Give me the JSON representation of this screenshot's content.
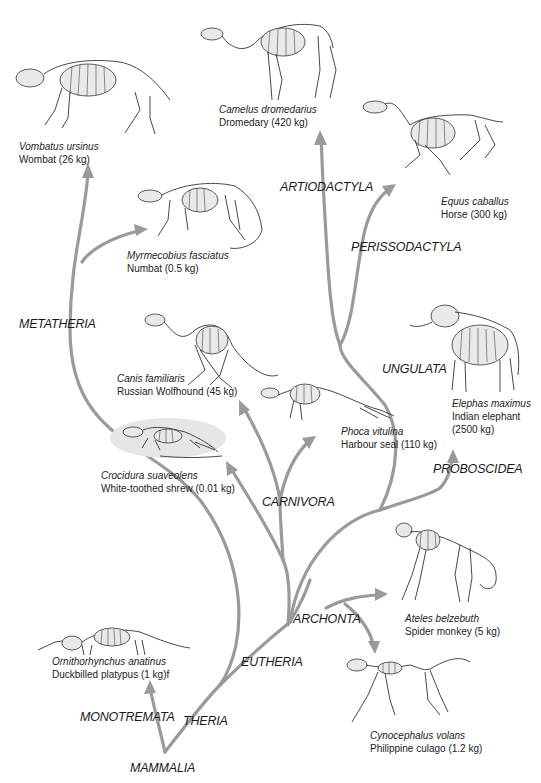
{
  "figure": {
    "colors": {
      "branch": "#9a9a9a",
      "text": "#1a1a1a",
      "background": "#ffffff",
      "shrew_highlight": "#e4e6e8"
    }
  },
  "clades": {
    "mammalia": "MAMMALIA",
    "monotremata": "MONOTREMATA",
    "theria": "THERIA",
    "metatheria": "METATHERIA",
    "eutheria": "EUTHERIA",
    "archonta": "ARCHONTA",
    "carnivora": "CARNIVORA",
    "ungulata": "UNGULATA",
    "proboscidea": "PROBOSCIDEA",
    "perissodactyla": "PERISSODACTYLA",
    "artiodactyla": "ARTIODACTYLA"
  },
  "species": [
    {
      "id": "wombat",
      "scientific": "Vombatus ursinus",
      "common": "Wombat (26 kg)"
    },
    {
      "id": "dromedary",
      "scientific": "Camelus dromedarius",
      "common": "Dromedary (420 kg)"
    },
    {
      "id": "horse",
      "scientific": "Equus caballus",
      "common": "Horse (300 kg)"
    },
    {
      "id": "numbat",
      "scientific": "Myrmecobius fasciatus",
      "common": "Numbat (0.5 kg)"
    },
    {
      "id": "wolfhound",
      "scientific": "Canis familiaris",
      "common": "Russian Wolfhound (45 kg)"
    },
    {
      "id": "seal",
      "scientific": "Phoca vitulina",
      "common": "Harbour seal (110 kg)"
    },
    {
      "id": "elephant",
      "scientific": "Elephas maximus",
      "common": "Indian elephant",
      "common2": "(2500 kg)"
    },
    {
      "id": "shrew",
      "scientific": "Crocidura suaveolens",
      "common": "White-toothed shrew (0.01 kg)"
    },
    {
      "id": "spider-monkey",
      "scientific": "Ateles belzebuth",
      "common": "Spider monkey (5 kg)"
    },
    {
      "id": "culago",
      "scientific": "Cynocephalus volans",
      "common": "Philippine culago (1.2 kg)"
    },
    {
      "id": "platypus",
      "scientific": "Ornithorhynchus anatinus",
      "common": "Duckbilled platypus (1 kg)f"
    }
  ]
}
